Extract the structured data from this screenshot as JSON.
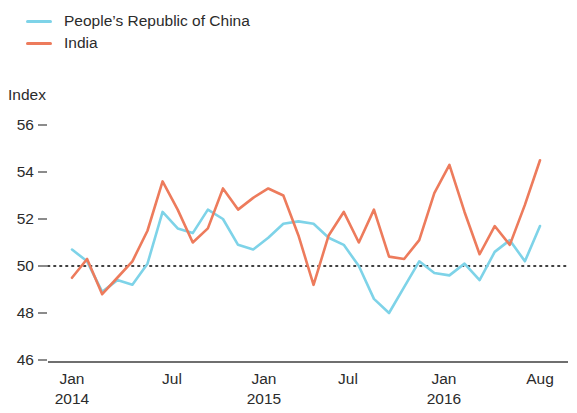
{
  "legend": {
    "position": "top-left",
    "entries": [
      {
        "label": "People’s Republic of China",
        "color": "#7ed3e8",
        "name": "china"
      },
      {
        "label": "India",
        "color": "#ed7b5c",
        "name": "india"
      }
    ]
  },
  "axis": {
    "y_title": "Index",
    "y_ticks": [
      "56",
      "54",
      "52",
      "50",
      "48",
      "46"
    ],
    "x_ticks": [
      {
        "month": "Jan",
        "year": "2014"
      },
      {
        "month": "Jul",
        "year": ""
      },
      {
        "month": "Jan",
        "year": "2015"
      },
      {
        "month": "Jul",
        "year": ""
      },
      {
        "month": "Jan",
        "year": "2016"
      },
      {
        "month": "Aug",
        "year": ""
      }
    ]
  },
  "reference_line": {
    "value": 50,
    "style": "dotted",
    "color": "#3f3f3f"
  },
  "chart_data": {
    "type": "line",
    "title": "",
    "subtitle": "",
    "xlabel": "",
    "ylabel": "Index",
    "ylim": [
      46,
      56
    ],
    "ytick_values": [
      56,
      54,
      52,
      50,
      48,
      46
    ],
    "grid": false,
    "legend_position": "top-left",
    "annotations": [
      {
        "type": "hline",
        "value": 50,
        "style": "dotted",
        "label": ""
      }
    ],
    "x": [
      "2014-01",
      "2014-02",
      "2014-03",
      "2014-04",
      "2014-05",
      "2014-06",
      "2014-07",
      "2014-08",
      "2014-09",
      "2014-10",
      "2014-11",
      "2014-12",
      "2015-01",
      "2015-02",
      "2015-03",
      "2015-04",
      "2015-05",
      "2015-06",
      "2015-07",
      "2015-08",
      "2015-09",
      "2015-10",
      "2015-11",
      "2015-12",
      "2016-01",
      "2016-02",
      "2016-03",
      "2016-04",
      "2016-05",
      "2016-06",
      "2016-07",
      "2016-08"
    ],
    "x_tick_labels": [
      "Jan 2014",
      "Jul",
      "Jan 2015",
      "Jul",
      "Jan 2016",
      "Aug"
    ],
    "x_tick_indices": [
      0,
      6,
      12,
      18,
      24,
      31
    ],
    "series": [
      {
        "name": "People’s Republic of China",
        "color": "#7ed3e8",
        "values": [
          50.7,
          50.2,
          48.9,
          49.4,
          49.2,
          50.1,
          52.3,
          51.6,
          51.4,
          52.4,
          52.0,
          50.9,
          50.7,
          51.2,
          51.8,
          51.9,
          51.8,
          51.2,
          50.9,
          50.0,
          48.6,
          48.0,
          49.1,
          50.2,
          49.7,
          49.6,
          50.1,
          49.4,
          50.6,
          51.1,
          50.2,
          51.7
        ]
      },
      {
        "name": "India",
        "color": "#ed7b5c",
        "values": [
          49.5,
          50.3,
          48.8,
          49.5,
          50.2,
          51.5,
          53.6,
          52.4,
          51.0,
          51.6,
          53.3,
          52.4,
          52.9,
          53.3,
          53.0,
          51.3,
          49.2,
          51.3,
          52.3,
          51.0,
          52.4,
          50.4,
          50.3,
          51.1,
          53.1,
          54.3,
          52.3,
          50.5,
          51.7,
          50.9,
          52.6,
          54.5
        ]
      }
    ]
  }
}
